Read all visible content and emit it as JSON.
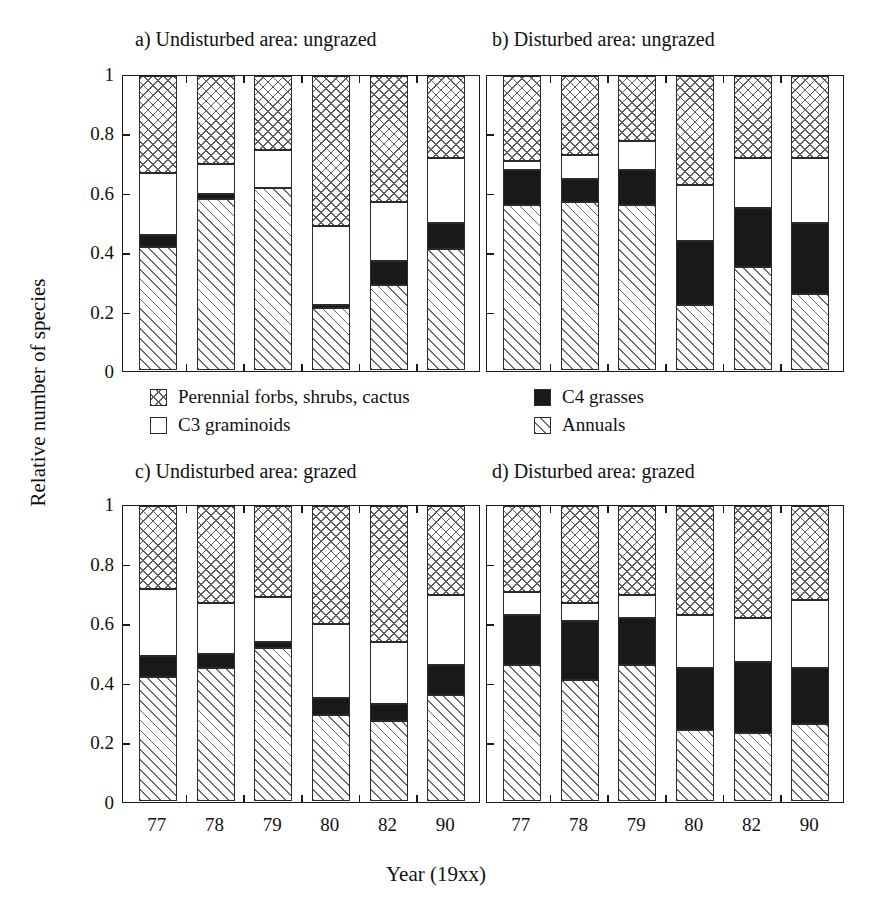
{
  "figure": {
    "ylabel": "Relative number of species",
    "xlabel": "Year (19xx)",
    "ytick_labels": [
      "1",
      "0.8",
      "0.6",
      "0.4",
      "0.2",
      "0"
    ],
    "ytick_values": [
      1,
      0.8,
      0.6,
      0.4,
      0.2,
      0
    ]
  },
  "legend": {
    "items": [
      {
        "label": "Perennial forbs, shrubs, cactus",
        "key": "perennial"
      },
      {
        "label": "C3 graminoids",
        "key": "c3"
      },
      {
        "label": "C4 grasses",
        "key": "c4"
      },
      {
        "label": "Annuals",
        "key": "annuals"
      }
    ]
  },
  "panels": [
    {
      "id": "a",
      "title": "a)  Undisturbed area: ungrazed"
    },
    {
      "id": "b",
      "title": "b)  Disturbed area: ungrazed"
    },
    {
      "id": "c",
      "title": "c)  Undisturbed area: grazed"
    },
    {
      "id": "d",
      "title": "d)  Disturbed area: grazed"
    }
  ],
  "chart_data": {
    "type": "bar",
    "subtype": "stacked-100",
    "xlabel": "Year (19xx)",
    "ylabel": "Relative number of species",
    "ylim": [
      0,
      1
    ],
    "ytick_values": [
      0,
      0.2,
      0.4,
      0.6,
      0.8,
      1
    ],
    "grid": false,
    "legend_position": "center-between-rows",
    "categories": [
      "77",
      "78",
      "79",
      "80",
      "82",
      "90"
    ],
    "series_order": [
      "Annuals",
      "C4 grasses",
      "C3 graminoids",
      "Perennial forbs, shrubs, cactus"
    ],
    "panels": [
      {
        "id": "a",
        "title": "a)  Undisturbed area: ungrazed",
        "series": [
          {
            "name": "Annuals",
            "values": [
              0.42,
              0.58,
              0.62,
              0.21,
              0.29,
              0.41
            ]
          },
          {
            "name": "C4 grasses",
            "values": [
              0.04,
              0.02,
              0.0,
              0.01,
              0.08,
              0.09
            ]
          },
          {
            "name": "C3 graminoids",
            "values": [
              0.21,
              0.1,
              0.13,
              0.27,
              0.2,
              0.22
            ]
          },
          {
            "name": "Perennial forbs, shrubs, cactus",
            "values": [
              0.33,
              0.3,
              0.25,
              0.51,
              0.43,
              0.28
            ]
          }
        ],
        "cumulative_tops": [
          [
            0.42,
            0.46,
            0.67,
            1.0
          ],
          [
            0.58,
            0.6,
            0.7,
            1.0
          ],
          [
            0.62,
            0.62,
            0.75,
            1.0
          ],
          [
            0.21,
            0.22,
            0.49,
            1.0
          ],
          [
            0.29,
            0.37,
            0.57,
            1.0
          ],
          [
            0.41,
            0.5,
            0.72,
            1.0
          ]
        ]
      },
      {
        "id": "b",
        "title": "b)  Disturbed area: ungrazed",
        "series": [
          {
            "name": "Annuals",
            "values": [
              0.56,
              0.57,
              0.56,
              0.22,
              0.35,
              0.26
            ]
          },
          {
            "name": "C4 grasses",
            "values": [
              0.12,
              0.08,
              0.12,
              0.22,
              0.2,
              0.24
            ]
          },
          {
            "name": "C3 graminoids",
            "values": [
              0.03,
              0.08,
              0.1,
              0.19,
              0.17,
              0.22
            ]
          },
          {
            "name": "Perennial forbs, shrubs, cactus",
            "values": [
              0.29,
              0.27,
              0.22,
              0.37,
              0.28,
              0.28
            ]
          }
        ],
        "cumulative_tops": [
          [
            0.56,
            0.68,
            0.71,
            1.0
          ],
          [
            0.57,
            0.65,
            0.73,
            1.0
          ],
          [
            0.56,
            0.68,
            0.78,
            1.0
          ],
          [
            0.22,
            0.44,
            0.63,
            1.0
          ],
          [
            0.35,
            0.55,
            0.72,
            1.0
          ],
          [
            0.26,
            0.5,
            0.72,
            1.0
          ]
        ]
      },
      {
        "id": "c",
        "title": "c)  Undisturbed area: grazed",
        "series": [
          {
            "name": "Annuals",
            "values": [
              0.42,
              0.45,
              0.52,
              0.29,
              0.27,
              0.36
            ]
          },
          {
            "name": "C4 grasses",
            "values": [
              0.07,
              0.05,
              0.02,
              0.06,
              0.06,
              0.1
            ]
          },
          {
            "name": "C3 graminoids",
            "values": [
              0.23,
              0.17,
              0.15,
              0.25,
              0.21,
              0.24
            ]
          },
          {
            "name": "Perennial forbs, shrubs, cactus",
            "values": [
              0.28,
              0.33,
              0.31,
              0.4,
              0.46,
              0.3
            ]
          }
        ],
        "cumulative_tops": [
          [
            0.42,
            0.49,
            0.72,
            1.0
          ],
          [
            0.45,
            0.5,
            0.67,
            1.0
          ],
          [
            0.52,
            0.54,
            0.69,
            1.0
          ],
          [
            0.29,
            0.35,
            0.6,
            1.0
          ],
          [
            0.27,
            0.33,
            0.54,
            1.0
          ],
          [
            0.36,
            0.46,
            0.7,
            1.0
          ]
        ]
      },
      {
        "id": "d",
        "title": "d)  Disturbed area: grazed",
        "series": [
          {
            "name": "Annuals",
            "values": [
              0.46,
              0.41,
              0.46,
              0.24,
              0.23,
              0.26
            ]
          },
          {
            "name": "C4 grasses",
            "values": [
              0.17,
              0.2,
              0.16,
              0.21,
              0.24,
              0.19
            ]
          },
          {
            "name": "C3 graminoids",
            "values": [
              0.08,
              0.06,
              0.08,
              0.18,
              0.15,
              0.23
            ]
          },
          {
            "name": "Perennial forbs, shrubs, cactus",
            "values": [
              0.29,
              0.33,
              0.3,
              0.37,
              0.38,
              0.32
            ]
          }
        ],
        "cumulative_tops": [
          [
            0.46,
            0.63,
            0.71,
            1.0
          ],
          [
            0.41,
            0.61,
            0.67,
            1.0
          ],
          [
            0.46,
            0.62,
            0.7,
            1.0
          ],
          [
            0.24,
            0.45,
            0.63,
            1.0
          ],
          [
            0.23,
            0.47,
            0.62,
            1.0
          ],
          [
            0.26,
            0.45,
            0.68,
            1.0
          ]
        ]
      }
    ]
  }
}
